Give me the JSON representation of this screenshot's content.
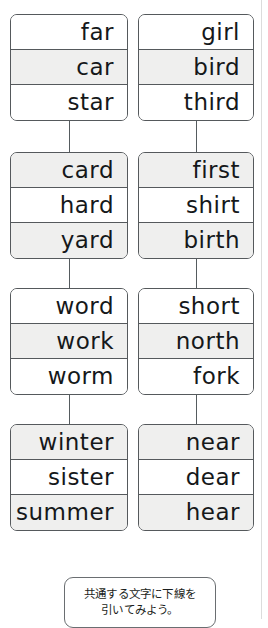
{
  "worksheet": {
    "type": "word-family-sorting-worksheet",
    "columns": 2,
    "rows_per_group": 3,
    "shade_color": "#efefee",
    "border_color": "#55595c",
    "text_color": "#15181a",
    "groups": [
      {
        "name": "group-1",
        "left": {
          "cells": [
            {
              "word": "far",
              "shaded": false
            },
            {
              "word": "car",
              "shaded": true
            },
            {
              "word": "star",
              "shaded": false
            }
          ]
        },
        "right": {
          "cells": [
            {
              "word": "girl",
              "shaded": false
            },
            {
              "word": "bird",
              "shaded": true
            },
            {
              "word": "third",
              "shaded": false
            }
          ]
        }
      },
      {
        "name": "group-2",
        "left": {
          "cells": [
            {
              "word": "card",
              "shaded": true
            },
            {
              "word": "hard",
              "shaded": false
            },
            {
              "word": "yard",
              "shaded": true
            }
          ]
        },
        "right": {
          "cells": [
            {
              "word": "first",
              "shaded": true
            },
            {
              "word": "shirt",
              "shaded": false
            },
            {
              "word": "birth",
              "shaded": true
            }
          ]
        }
      },
      {
        "name": "group-3",
        "left": {
          "cells": [
            {
              "word": "word",
              "shaded": false
            },
            {
              "word": "work",
              "shaded": true
            },
            {
              "word": "worm",
              "shaded": false
            }
          ]
        },
        "right": {
          "cells": [
            {
              "word": "short",
              "shaded": false
            },
            {
              "word": "north",
              "shaded": true
            },
            {
              "word": "fork",
              "shaded": false
            }
          ]
        }
      },
      {
        "name": "group-4",
        "left": {
          "cells": [
            {
              "word": "winter",
              "shaded": true
            },
            {
              "word": "sister",
              "shaded": false
            },
            {
              "word": "summer",
              "shaded": true
            }
          ]
        },
        "right": {
          "cells": [
            {
              "word": "near",
              "shaded": true
            },
            {
              "word": "dear",
              "shaded": false
            },
            {
              "word": "hear",
              "shaded": true
            }
          ]
        }
      }
    ]
  },
  "instruction": {
    "lines": [
      "共通する文字に下線を",
      "引いてみよう。"
    ]
  }
}
